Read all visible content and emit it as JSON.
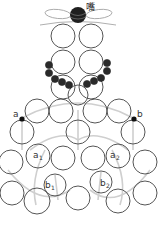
{
  "diagram": {
    "type": "beading pattern",
    "top_knot_label": "嘴",
    "point_labels": {
      "a": "a",
      "b": "b",
      "a1": {
        "base": "a",
        "sub": "1"
      },
      "a2": {
        "base": "a",
        "sub": "2"
      },
      "b1": {
        "base": "b",
        "sub": "1"
      },
      "b2": {
        "base": "b",
        "sub": "2"
      }
    },
    "colors": {
      "bead_outline": "#555555",
      "dark_bead": "#2a2a2a",
      "guide_arc": "#cfcfcf",
      "thread": "#9a9a9a",
      "background": "#ffffff"
    },
    "top_knot": {
      "cx": 78,
      "cy": 15,
      "r": 8
    },
    "column_beads": [
      {
        "cx": 63,
        "cy": 36,
        "r": 12
      },
      {
        "cx": 91,
        "cy": 36,
        "r": 12
      },
      {
        "cx": 63,
        "cy": 62,
        "r": 12
      },
      {
        "cx": 91,
        "cy": 62,
        "r": 12
      },
      {
        "cx": 63,
        "cy": 87,
        "r": 12
      },
      {
        "cx": 91,
        "cy": 87,
        "r": 12
      },
      {
        "cx": 78,
        "cy": 95,
        "r": 10
      }
    ],
    "dark_beads": [
      {
        "cx": 49,
        "cy": 65,
        "r": 3.6
      },
      {
        "cx": 49,
        "cy": 73,
        "r": 3.6
      },
      {
        "cx": 55,
        "cy": 79,
        "r": 3.6
      },
      {
        "cx": 62,
        "cy": 82,
        "r": 3.6
      },
      {
        "cx": 69,
        "cy": 85,
        "r": 3.6
      },
      {
        "cx": 107,
        "cy": 63,
        "r": 3.6
      },
      {
        "cx": 107,
        "cy": 71,
        "r": 3.6
      },
      {
        "cx": 101,
        "cy": 78,
        "r": 3.6
      },
      {
        "cx": 94,
        "cy": 81,
        "r": 3.6
      },
      {
        "cx": 87,
        "cy": 84,
        "r": 3.6
      }
    ],
    "ring_beads": [
      {
        "cx": 37,
        "cy": 111,
        "r": 12
      },
      {
        "cx": 61,
        "cy": 111,
        "r": 12
      },
      {
        "cx": 95,
        "cy": 111,
        "r": 12
      },
      {
        "cx": 119,
        "cy": 111,
        "r": 12
      },
      {
        "cx": 22,
        "cy": 132,
        "r": 12
      },
      {
        "cx": 78,
        "cy": 132,
        "r": 12
      },
      {
        "cx": 133,
        "cy": 132,
        "r": 12
      },
      {
        "cx": 11,
        "cy": 162,
        "r": 12
      },
      {
        "cx": 38,
        "cy": 156,
        "r": 12
      },
      {
        "cx": 63,
        "cy": 158,
        "r": 12
      },
      {
        "cx": 93,
        "cy": 158,
        "r": 12
      },
      {
        "cx": 118,
        "cy": 156,
        "r": 12
      },
      {
        "cx": 145,
        "cy": 162,
        "r": 12
      },
      {
        "cx": 55,
        "cy": 185,
        "r": 11
      },
      {
        "cx": 101,
        "cy": 182,
        "r": 11
      },
      {
        "cx": 12,
        "cy": 193,
        "r": 12
      },
      {
        "cx": 37,
        "cy": 201,
        "r": 13
      },
      {
        "cx": 78,
        "cy": 198,
        "r": 12
      },
      {
        "cx": 118,
        "cy": 201,
        "r": 12
      },
      {
        "cx": 145,
        "cy": 193,
        "r": 12
      }
    ]
  }
}
